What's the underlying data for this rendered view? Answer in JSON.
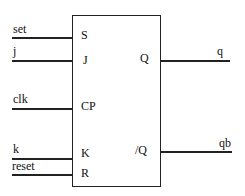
{
  "diagram": {
    "type": "logic-symbol",
    "block": {
      "name": "JK flip-flop",
      "inputs": [
        {
          "pin": "S",
          "signal": "set"
        },
        {
          "pin": "J",
          "signal": "j"
        },
        {
          "pin": "CP",
          "signal": "clk"
        },
        {
          "pin": "K",
          "signal": "k"
        },
        {
          "pin": "R",
          "signal": "reset"
        }
      ],
      "outputs": [
        {
          "pin": "Q",
          "signal": "q"
        },
        {
          "pin": "/Q",
          "signal": "qb"
        }
      ]
    },
    "colors": {
      "line": "#222222",
      "background": "#ffffff"
    }
  }
}
